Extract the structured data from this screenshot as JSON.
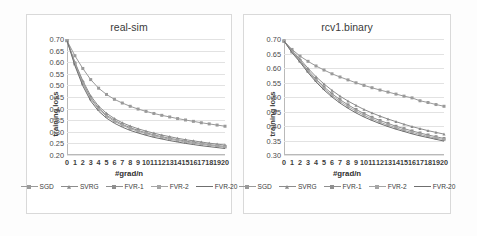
{
  "figure": {
    "xlabel": "#grad/n",
    "ylabel": "training loss"
  },
  "legend": {
    "items": [
      {
        "label": "SGD",
        "color": "#9a9a9a",
        "marker": "square"
      },
      {
        "label": "SVRG",
        "color": "#8c8c8c",
        "marker": "triangle"
      },
      {
        "label": "FVR-1",
        "color": "#8f8f8f",
        "marker": "square"
      },
      {
        "label": "FVR-2",
        "color": "#a5a5a5",
        "marker": "square"
      },
      {
        "label": "FVR-20",
        "color": "#6f6f6f",
        "marker": "none"
      }
    ]
  },
  "chart_data": [
    {
      "type": "line",
      "title": "real-sim",
      "xlabel": "#grad/n",
      "ylabel": "training loss",
      "xlim": [
        0,
        20
      ],
      "ylim": [
        0.2,
        0.7
      ],
      "yticks": [
        "0.70",
        "0.65",
        "0.60",
        "0.55",
        "0.50",
        "0.45",
        "0.40",
        "0.35",
        "0.30",
        "0.25",
        "0.20"
      ],
      "ytick_values": [
        0.7,
        0.65,
        0.6,
        0.55,
        0.5,
        0.45,
        0.4,
        0.35,
        0.3,
        0.25,
        0.2
      ],
      "x": [
        0,
        1,
        2,
        3,
        4,
        5,
        6,
        7,
        8,
        9,
        10,
        11,
        12,
        13,
        14,
        15,
        16,
        17,
        18,
        19,
        20
      ],
      "xticks": [
        "0",
        "1",
        "2",
        "3",
        "4",
        "5",
        "6",
        "7",
        "8",
        "9",
        "10",
        "11",
        "12",
        "13",
        "14",
        "15",
        "16",
        "17",
        "18",
        "19",
        "20"
      ],
      "grid": true,
      "legend_position": "bottom",
      "series": [
        {
          "name": "SGD",
          "color": "#9a9a9a",
          "marker": "square",
          "values": [
            0.693,
            0.628,
            0.573,
            0.525,
            0.488,
            0.461,
            0.44,
            0.424,
            0.41,
            0.398,
            0.388,
            0.379,
            0.371,
            0.364,
            0.357,
            0.351,
            0.345,
            0.339,
            0.334,
            0.329,
            0.324
          ]
        },
        {
          "name": "SVRG",
          "color": "#8c8c8c",
          "marker": "triangle",
          "values": [
            0.693,
            0.6,
            0.52,
            0.455,
            0.41,
            0.38,
            0.357,
            0.339,
            0.325,
            0.313,
            0.303,
            0.294,
            0.286,
            0.279,
            0.272,
            0.266,
            0.261,
            0.256,
            0.251,
            0.247,
            0.243
          ]
        },
        {
          "name": "FVR-1",
          "color": "#8f8f8f",
          "marker": "square",
          "values": [
            0.693,
            0.596,
            0.512,
            0.447,
            0.402,
            0.372,
            0.35,
            0.332,
            0.318,
            0.306,
            0.296,
            0.287,
            0.279,
            0.272,
            0.266,
            0.26,
            0.255,
            0.25,
            0.245,
            0.241,
            0.237
          ]
        },
        {
          "name": "FVR-2",
          "color": "#a5a5a5",
          "marker": "square",
          "values": [
            0.693,
            0.592,
            0.507,
            0.442,
            0.397,
            0.367,
            0.345,
            0.328,
            0.314,
            0.302,
            0.292,
            0.283,
            0.275,
            0.268,
            0.262,
            0.256,
            0.251,
            0.246,
            0.242,
            0.238,
            0.234
          ]
        },
        {
          "name": "FVR-20",
          "color": "#6f6f6f",
          "marker": "none",
          "values": [
            0.693,
            0.585,
            0.498,
            0.433,
            0.389,
            0.359,
            0.337,
            0.32,
            0.306,
            0.295,
            0.285,
            0.276,
            0.269,
            0.262,
            0.256,
            0.25,
            0.245,
            0.24,
            0.236,
            0.232,
            0.228
          ]
        }
      ]
    },
    {
      "type": "line",
      "title": "rcv1.binary",
      "xlabel": "#grad/n",
      "ylabel": "training loss",
      "xlim": [
        0,
        20
      ],
      "ylim": [
        0.3,
        0.7
      ],
      "yticks": [
        "0.70",
        "0.65",
        "0.60",
        "0.55",
        "0.50",
        "0.45",
        "0.40",
        "0.35",
        "0.30"
      ],
      "ytick_values": [
        0.7,
        0.65,
        0.6,
        0.55,
        0.5,
        0.45,
        0.4,
        0.35,
        0.3
      ],
      "x": [
        0,
        1,
        2,
        3,
        4,
        5,
        6,
        7,
        8,
        9,
        10,
        11,
        12,
        13,
        14,
        15,
        16,
        17,
        18,
        19,
        20
      ],
      "xticks": [
        "0",
        "1",
        "2",
        "3",
        "4",
        "5",
        "6",
        "7",
        "8",
        "9",
        "10",
        "11",
        "12",
        "13",
        "14",
        "15",
        "16",
        "17",
        "18",
        "19",
        "20"
      ],
      "grid": true,
      "legend_position": "bottom",
      "series": [
        {
          "name": "SGD",
          "color": "#9a9a9a",
          "marker": "square",
          "values": [
            0.693,
            0.664,
            0.641,
            0.623,
            0.607,
            0.593,
            0.58,
            0.569,
            0.559,
            0.549,
            0.54,
            0.532,
            0.524,
            0.517,
            0.51,
            0.503,
            0.497,
            0.487,
            0.481,
            0.474,
            0.468
          ]
        },
        {
          "name": "SVRG",
          "color": "#8c8c8c",
          "marker": "triangle",
          "values": [
            0.693,
            0.66,
            0.631,
            0.599,
            0.57,
            0.545,
            0.523,
            0.503,
            0.486,
            0.471,
            0.457,
            0.445,
            0.434,
            0.424,
            0.415,
            0.406,
            0.398,
            0.391,
            0.384,
            0.378,
            0.372
          ]
        },
        {
          "name": "FVR-1",
          "color": "#8f8f8f",
          "marker": "square",
          "values": [
            0.693,
            0.657,
            0.626,
            0.592,
            0.562,
            0.535,
            0.511,
            0.491,
            0.473,
            0.457,
            0.443,
            0.43,
            0.419,
            0.409,
            0.399,
            0.391,
            0.383,
            0.376,
            0.369,
            0.363,
            0.357
          ]
        },
        {
          "name": "FVR-2",
          "color": "#a5a5a5",
          "marker": "square",
          "values": [
            0.693,
            0.655,
            0.623,
            0.588,
            0.557,
            0.529,
            0.505,
            0.485,
            0.467,
            0.451,
            0.437,
            0.424,
            0.413,
            0.403,
            0.394,
            0.385,
            0.378,
            0.371,
            0.364,
            0.358,
            0.353
          ]
        },
        {
          "name": "FVR-20",
          "color": "#6f6f6f",
          "marker": "none",
          "values": [
            0.693,
            0.653,
            0.62,
            0.584,
            0.552,
            0.524,
            0.5,
            0.479,
            0.461,
            0.445,
            0.431,
            0.419,
            0.408,
            0.398,
            0.389,
            0.381,
            0.373,
            0.366,
            0.36,
            0.354,
            0.348
          ]
        }
      ]
    }
  ]
}
